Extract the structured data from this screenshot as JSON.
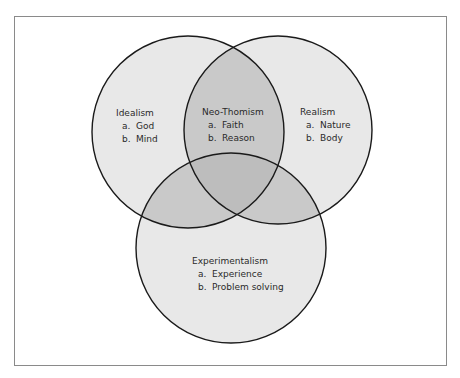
{
  "diagram": {
    "type": "venn",
    "colors": {
      "frame_border": "#8a8a8a",
      "circle_stroke": "#1a1a1a",
      "single_fill": "#e8e8e8",
      "double_overlap": "#c9c9c9",
      "triple_overlap": "#bdbdbd",
      "text": "#2a2a2a"
    },
    "sets": {
      "idealism": {
        "title": "Idealism",
        "items": [
          {
            "marker": "a.",
            "text": "God"
          },
          {
            "marker": "b.",
            "text": "Mind"
          }
        ]
      },
      "realism": {
        "title": "Realism",
        "items": [
          {
            "marker": "a.",
            "text": "Nature"
          },
          {
            "marker": "b.",
            "text": "Body"
          }
        ]
      },
      "neo_thomism": {
        "title": "Neo-Thomism",
        "items": [
          {
            "marker": "a.",
            "text": "Faith"
          },
          {
            "marker": "b.",
            "text": "Reason"
          }
        ]
      },
      "experimentalism": {
        "title": "Experimentalism",
        "items": [
          {
            "marker": "a.",
            "text": "Experience"
          },
          {
            "marker": "b.",
            "text": "Problem solving"
          }
        ]
      }
    }
  }
}
